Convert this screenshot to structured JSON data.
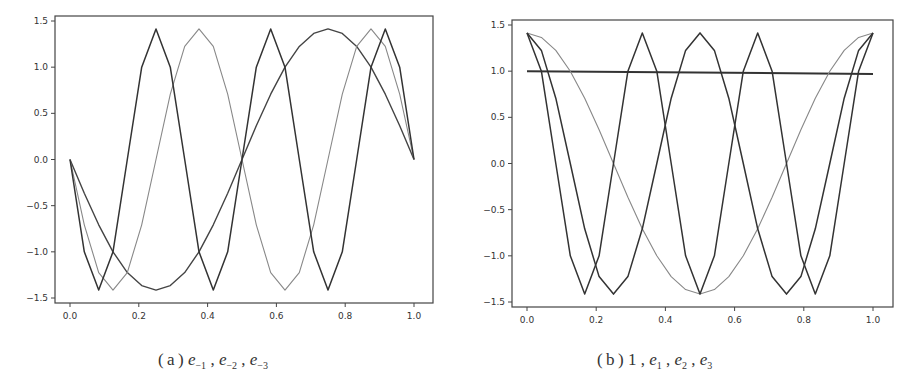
{
  "chart_data": [
    {
      "id": "a",
      "type": "line",
      "title": "",
      "caption": {
        "label": "(a)",
        "terms": [
          {
            "base": "e",
            "sub": "-1"
          },
          {
            "base": "e",
            "sub": "-2"
          },
          {
            "base": "e",
            "sub": "-3"
          }
        ]
      },
      "xlabel": "",
      "ylabel": "",
      "xlim": [
        0.0,
        1.0
      ],
      "ylim": [
        -1.5,
        1.5
      ],
      "xticks": [
        "0.0",
        "0.2",
        "0.4",
        "0.6",
        "0.8",
        "1.0"
      ],
      "yticks": [
        "1.5",
        "1.0",
        "0.5",
        "0.0",
        "-0.5",
        "-1.0",
        "-1.5"
      ],
      "grid": false,
      "legend": null,
      "x": [
        0,
        0.0833,
        0.125,
        0.1667,
        0.25,
        0.3333,
        0.375,
        0.4167,
        0.5,
        0.5833,
        0.625,
        0.6667,
        0.75,
        0.8333,
        0.875,
        0.9167,
        1.0
      ],
      "series": [
        {
          "name": "e_-1",
          "formula": "-sqrt(2)*sin(2*pi*x)",
          "color": "#444444",
          "width": 1.4
        },
        {
          "name": "e_-2",
          "formula": "-sqrt(2)*sin(4*pi*x)",
          "color": "#888888",
          "width": 1.1
        },
        {
          "name": "e_-3",
          "formula": "-sqrt(2)*sin(6*pi*x)",
          "color": "#333333",
          "width": 1.5
        }
      ]
    },
    {
      "id": "b",
      "type": "line",
      "title": "",
      "caption": {
        "label": "(b)",
        "terms": [
          {
            "base": "1",
            "sub": ""
          },
          {
            "base": "e",
            "sub": "1"
          },
          {
            "base": "e",
            "sub": "2"
          },
          {
            "base": "e",
            "sub": "3"
          }
        ]
      },
      "xlabel": "",
      "ylabel": "",
      "xlim": [
        0.0,
        1.0
      ],
      "ylim": [
        -1.5,
        1.5
      ],
      "xticks": [
        "0.0",
        "0.2",
        "0.4",
        "0.6",
        "0.8",
        "1.0"
      ],
      "yticks": [
        "1.5",
        "1.0",
        "0.5",
        "0.0",
        "-0.5",
        "-1.0",
        "-1.5"
      ],
      "grid": false,
      "legend": null,
      "series": [
        {
          "name": "1",
          "formula": "1",
          "color": "#333333",
          "width": 2.0
        },
        {
          "name": "e_1",
          "formula": "sqrt(2)*cos(2*pi*x)",
          "color": "#888888",
          "width": 1.1
        },
        {
          "name": "e_2",
          "formula": "sqrt(2)*cos(4*pi*x)",
          "color": "#333333",
          "width": 1.5
        },
        {
          "name": "e_3",
          "formula": "sqrt(2)*cos(6*pi*x)",
          "color": "#333333",
          "width": 1.5
        }
      ]
    }
  ]
}
